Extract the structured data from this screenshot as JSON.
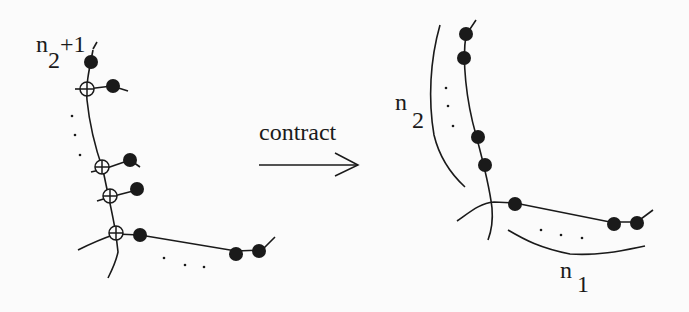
{
  "diagram": {
    "left": {
      "label_main": "n",
      "label_sub": "2",
      "label_suffix": "+1",
      "ellipsis": "..."
    },
    "arrow": {
      "label": "contract"
    },
    "right": {
      "label_n2_main": "n",
      "label_n2_sub": "2",
      "label_n1_main": "n",
      "label_n1_sub": "1"
    },
    "colors": {
      "ink": "#1a1a1a",
      "background": "#fbfbfb"
    }
  }
}
